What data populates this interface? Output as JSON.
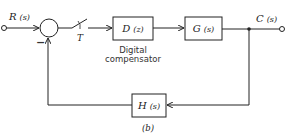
{
  "diagram": {
    "type": "block-diagram",
    "caption": "(b)",
    "input": {
      "label": "R",
      "arg": "(s)"
    },
    "output": {
      "label": "C",
      "arg": "(s)"
    },
    "summing_junction": {
      "minus_sign": "−"
    },
    "sampler": {
      "label": "T"
    },
    "blocks": [
      {
        "id": "D",
        "label": "D",
        "arg": "(z)",
        "caption_line1": "Digital",
        "caption_line2": "compensator"
      },
      {
        "id": "G",
        "label": "G",
        "arg": "(s)"
      },
      {
        "id": "H",
        "label": "H",
        "arg": "(s)"
      }
    ],
    "edges": [
      {
        "from": "R",
        "to": "sum"
      },
      {
        "from": "sum",
        "to": "sampler"
      },
      {
        "from": "sampler",
        "to": "D"
      },
      {
        "from": "D",
        "to": "G"
      },
      {
        "from": "G",
        "to": "C"
      },
      {
        "from": "C",
        "to": "H"
      },
      {
        "from": "H",
        "to": "sum",
        "sign": "-"
      }
    ],
    "colors": {
      "line": "#222222",
      "background": "#ffffff"
    }
  }
}
